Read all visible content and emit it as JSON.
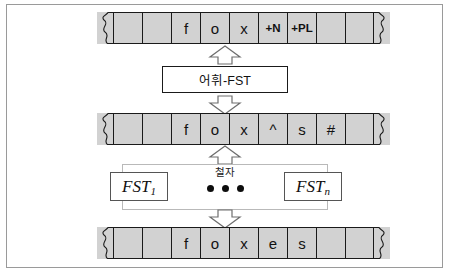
{
  "figure": {
    "colors": {
      "tape_fill": "#d2d2d2",
      "tape_border": "#1a1a1a",
      "box_fill": "#ffffff",
      "box_border": "#1a1a1a",
      "frame_border": "#9a9a9a",
      "dot_color": "#0d0d0d"
    }
  },
  "tapes": [
    {
      "name": "lexical-tape",
      "cells": [
        "",
        "",
        "f",
        "o",
        "x",
        "+N",
        "+PL",
        "",
        ""
      ],
      "small_indices": [
        5,
        6
      ]
    },
    {
      "name": "intermediate-tape",
      "cells": [
        "",
        "",
        "f",
        "o",
        "x",
        "^",
        "s",
        "#",
        ""
      ],
      "small_indices": []
    },
    {
      "name": "surface-tape",
      "cells": [
        "",
        "",
        "f",
        "o",
        "x",
        "e",
        "s",
        "",
        ""
      ],
      "small_indices": []
    }
  ],
  "lexical_fst": {
    "label": "어휘-FST"
  },
  "spelling_stage": {
    "label": "철자",
    "first_fst": {
      "base": "FST",
      "subscript": "1"
    },
    "last_fst": {
      "base": "FST",
      "subscript": "n"
    },
    "ellipsis_count": 3
  },
  "arrows": [
    {
      "name": "arrow-up-to-lexical-tape",
      "direction": "up"
    },
    {
      "name": "arrow-down-from-lexical-fst",
      "direction": "down"
    },
    {
      "name": "arrow-up-to-intermediate-tape",
      "direction": "up"
    },
    {
      "name": "arrow-down-to-surface-tape",
      "direction": "down"
    }
  ]
}
